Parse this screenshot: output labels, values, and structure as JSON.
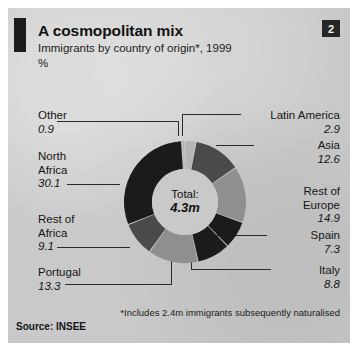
{
  "panel": {
    "badge": "2",
    "title": "A cosmopolitan mix",
    "subtitle": "Immigrants by country of origin*, 1999",
    "unit": "%",
    "footnote": "*Includes 2.4m immigrants subsequently naturalised",
    "source": "Source: INSEE"
  },
  "center": {
    "line1": "Total:",
    "line2": "4.3m"
  },
  "labels": {
    "other": {
      "name": "Other",
      "value": "0.9"
    },
    "north_africa": {
      "name": "North\nAfrica",
      "value": "30.1"
    },
    "rest_africa": {
      "name": "Rest of\nAfrica",
      "value": "9.1"
    },
    "portugal": {
      "name": "Portugal",
      "value": "13.3"
    },
    "latin": {
      "name": "Latin America",
      "value": "2.9"
    },
    "asia": {
      "name": "Asia",
      "value": "12.6"
    },
    "rest_europe": {
      "name": "Rest of\nEurope",
      "value": "14.9"
    },
    "spain": {
      "name": "Spain",
      "value": "7.3"
    },
    "italy": {
      "name": "Italy",
      "value": "8.8"
    }
  },
  "chart_data": {
    "type": "pie",
    "variant": "donut",
    "title": "A cosmopolitan mix",
    "subtitle": "Immigrants by country of origin*, 1999",
    "ylabel": "%",
    "unit": "%",
    "center_text": "Total: 4.3m",
    "total_label": "Total:",
    "total_value": "4.3m",
    "legend": "leader-line labels",
    "start_angle_deg": 0,
    "direction": "clockwise",
    "categories": [
      "Latin America",
      "Asia",
      "Rest of Europe",
      "Spain",
      "Italy",
      "Portugal",
      "Rest of Africa",
      "North Africa",
      "Other"
    ],
    "values": [
      2.9,
      12.6,
      14.9,
      7.3,
      8.8,
      13.3,
      9.1,
      30.1,
      0.9
    ],
    "colors": [
      "#b5b5b5",
      "#4a4a4a",
      "#8f8f8f",
      "#1b1b1b",
      "#1b1b1b",
      "#8f8f8f",
      "#4a4a4a",
      "#1b1b1b",
      "#b5b5b5"
    ],
    "slices": [
      {
        "label": "Latin America",
        "value": 2.9,
        "color": "#b5b5b5"
      },
      {
        "label": "Asia",
        "value": 12.6,
        "color": "#4a4a4a"
      },
      {
        "label": "Rest of Europe",
        "value": 14.9,
        "color": "#8f8f8f"
      },
      {
        "label": "Spain",
        "value": 7.3,
        "color": "#1b1b1b"
      },
      {
        "label": "Italy",
        "value": 8.8,
        "color": "#1b1b1b"
      },
      {
        "label": "Portugal",
        "value": 13.3,
        "color": "#8f8f8f"
      },
      {
        "label": "Rest of Africa",
        "value": 9.1,
        "color": "#4a4a4a"
      },
      {
        "label": "North Africa",
        "value": 30.1,
        "color": "#1b1b1b"
      },
      {
        "label": "Other",
        "value": 0.9,
        "color": "#b5b5b5"
      }
    ],
    "annotations": [
      "*Includes 2.4m immigrants subsequently naturalised",
      "Source: INSEE"
    ]
  }
}
